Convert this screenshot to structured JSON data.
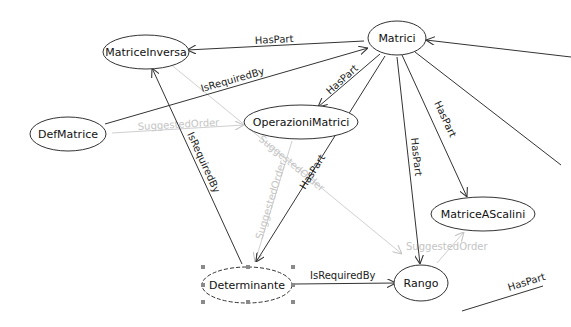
{
  "diagram": {
    "nodes": {
      "matrici": {
        "label": "Matrici"
      },
      "matrice_inversa": {
        "label": "MatriceInversa"
      },
      "def_matrice": {
        "label": "DefMatrice"
      },
      "operazioni_matrici": {
        "label": "OperazioniMatrici"
      },
      "matrice_a_scalini": {
        "label": "MatriceAScalini"
      },
      "determinante": {
        "label": "Determinante",
        "selected": true
      },
      "rango": {
        "label": "Rango"
      }
    },
    "edges": {
      "matrici_inversa": {
        "label": "HasPart",
        "from": "Matrici",
        "to": "MatriceInversa"
      },
      "def_matrici": {
        "label": "IsRequiredBy",
        "from": "DefMatrice",
        "to": "Matrici"
      },
      "matrici_operazioni": {
        "label": "HasPart",
        "from": "Matrici",
        "to": "OperazioniMatrici"
      },
      "matrici_determinante": {
        "label": "HasPart",
        "from": "Matrici",
        "to": "Determinante"
      },
      "matrici_rango": {
        "label": "HasPart",
        "from": "Matrici",
        "to": "Rango"
      },
      "matrici_scalini": {
        "label": "HasPart",
        "from": "Matrici",
        "to": "MatriceAScalini"
      },
      "determinante_inversa": {
        "label": "IsRequiredBy",
        "from": "Determinante",
        "to": "MatriceInversa"
      },
      "determinante_rango": {
        "label": "IsRequiredBy",
        "from": "Determinante",
        "to": "Rango"
      },
      "def_operazioni": {
        "label": "SuggestedOrder",
        "from": "DefMatrice",
        "to": "OperazioniMatrici"
      },
      "inversa_rango": {
        "label": "SuggestedOrder",
        "from": "MatriceInversa",
        "to": "Rango"
      },
      "operazioni_determinante": {
        "label": "SuggestedOrder",
        "from": "OperazioniMatrici",
        "to": "Determinante"
      },
      "rango_scalini": {
        "label": "SuggestedOrder",
        "from": "Rango",
        "to": "MatriceAScalini"
      },
      "offscreen_haspart": {
        "label": "HasPart"
      }
    },
    "colors": {
      "edge_dark": "#333333",
      "edge_light": "#c8c8c8",
      "node_fill": "#ffffff",
      "selection_handle": "#8a8a8a"
    }
  }
}
